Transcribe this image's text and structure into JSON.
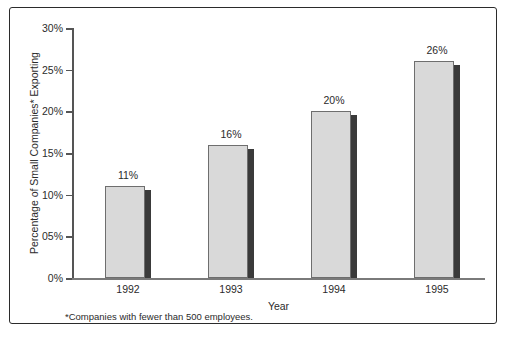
{
  "chart_data": {
    "type": "bar",
    "title": "",
    "categories": [
      "1992",
      "1993",
      "1994",
      "1995"
    ],
    "values": [
      11,
      16,
      20,
      26
    ],
    "data_labels": [
      "11%",
      "16%",
      "20%",
      "26%"
    ],
    "xlabel": "Year",
    "ylabel": "Percentage of Small Companies* Exporting",
    "ylim": [
      0,
      30
    ],
    "ytick_labels": [
      "30%",
      "25%",
      "20%",
      "15%",
      "10%",
      "05%",
      "0%"
    ],
    "ytick_values": [
      30,
      25,
      20,
      15,
      10,
      5,
      0
    ],
    "grid": false,
    "legend": "none",
    "footnote": "*Companies with fewer than 500 employees.",
    "colors": {
      "bar_fill": "#d9d9d9",
      "bar_border": "#6e6e6e",
      "bar_shadow": "#3a3a3a",
      "axis": "#555555",
      "text": "#2b2b2b",
      "frame_border": "#2b2b2b",
      "frame_shadow": "#9a9a9a",
      "background": "#ffffff"
    }
  }
}
